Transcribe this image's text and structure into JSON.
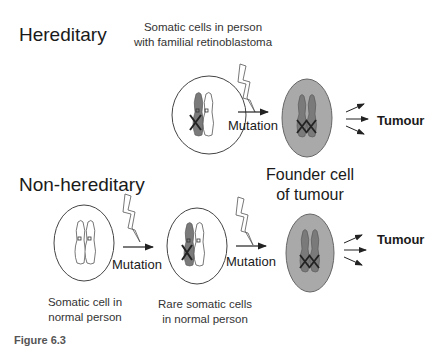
{
  "rows": {
    "hereditary": {
      "title": "Hereditary",
      "cell_label": "Somatic cells in person with familial retinoblastoma",
      "cell_label_line1": "Somatic cells in person",
      "cell_label_line2": "with familial retinoblastoma",
      "mutation_label": "Mutation",
      "outcome_label": "Tumour"
    },
    "non_hereditary": {
      "title": "Non-hereditary",
      "cell1_label_line1": "Somatic cell in",
      "cell1_label_line2": "normal person",
      "cell2_label_line1": "Rare somatic cells",
      "cell2_label_line2": "in normal person",
      "mutation1_label": "Mutation",
      "mutation2_label": "Mutation",
      "outcome_label": "Tumour"
    }
  },
  "founder_label_line1": "Founder cell",
  "founder_label_line2": "of tumour",
  "caption": "Figure 6.3",
  "colors": {
    "tumour_cell_fill": "#a9a9a9",
    "mutant_chromosome": "#7a7a7a",
    "outline": "#333333"
  }
}
